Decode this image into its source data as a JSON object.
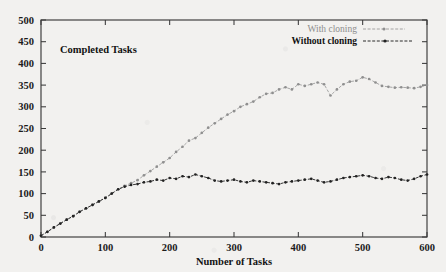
{
  "chart_data": {
    "type": "line",
    "title": "",
    "plot_label": "Completed Tasks",
    "xlabel": "Number of Tasks",
    "ylabel": "",
    "xlim": [
      0,
      600
    ],
    "ylim": [
      0,
      500
    ],
    "xticks": [
      0,
      100,
      200,
      300,
      400,
      500,
      600
    ],
    "yticks": [
      0,
      50,
      100,
      150,
      200,
      250,
      300,
      350,
      400,
      450,
      500
    ],
    "grid": false,
    "legend_position": "top-right",
    "legend": [
      "With cloning",
      "Without cloning"
    ],
    "colors": {
      "with_cloning": "#9a9a9a",
      "without_cloning": "#2b2b2b",
      "axis": "#3a3a3a",
      "background": "#f2f1ef"
    },
    "series": [
      {
        "name": "With cloning",
        "marker": "point",
        "linestyle": "dashed",
        "x": [
          0,
          10,
          20,
          30,
          40,
          50,
          60,
          70,
          80,
          90,
          100,
          110,
          120,
          130,
          140,
          150,
          160,
          170,
          180,
          190,
          200,
          210,
          220,
          230,
          240,
          250,
          260,
          270,
          280,
          290,
          300,
          310,
          320,
          330,
          340,
          350,
          360,
          370,
          380,
          390,
          400,
          410,
          420,
          430,
          440,
          450,
          460,
          470,
          480,
          490,
          500,
          510,
          520,
          530,
          540,
          550,
          560,
          570,
          580,
          590,
          600
        ],
        "y": [
          3,
          12,
          22,
          31,
          40,
          48,
          58,
          66,
          74,
          82,
          90,
          100,
          110,
          118,
          124,
          131,
          142,
          152,
          162,
          172,
          182,
          196,
          208,
          222,
          228,
          240,
          252,
          262,
          272,
          282,
          290,
          300,
          306,
          312,
          322,
          330,
          332,
          340,
          345,
          340,
          352,
          348,
          352,
          356,
          352,
          326,
          340,
          352,
          358,
          360,
          368,
          364,
          356,
          348,
          346,
          344,
          345,
          344,
          343,
          346,
          350
        ]
      },
      {
        "name": "Without cloning",
        "marker": "point",
        "linestyle": "dashed",
        "x": [
          0,
          10,
          20,
          30,
          40,
          50,
          60,
          70,
          80,
          90,
          100,
          110,
          120,
          130,
          140,
          150,
          160,
          170,
          180,
          190,
          200,
          210,
          220,
          230,
          240,
          250,
          260,
          270,
          280,
          290,
          300,
          310,
          320,
          330,
          340,
          350,
          360,
          370,
          380,
          390,
          400,
          410,
          420,
          430,
          440,
          450,
          460,
          470,
          480,
          490,
          500,
          510,
          520,
          530,
          540,
          550,
          560,
          570,
          580,
          590,
          600
        ],
        "y": [
          3,
          12,
          22,
          31,
          40,
          48,
          58,
          66,
          74,
          82,
          90,
          100,
          110,
          116,
          120,
          122,
          126,
          128,
          132,
          130,
          136,
          134,
          140,
          138,
          144,
          140,
          136,
          130,
          128,
          130,
          132,
          128,
          126,
          130,
          128,
          126,
          124,
          122,
          126,
          128,
          130,
          132,
          134,
          130,
          126,
          128,
          132,
          136,
          138,
          140,
          142,
          140,
          136,
          134,
          138,
          136,
          132,
          130,
          134,
          140,
          144
        ]
      }
    ]
  }
}
